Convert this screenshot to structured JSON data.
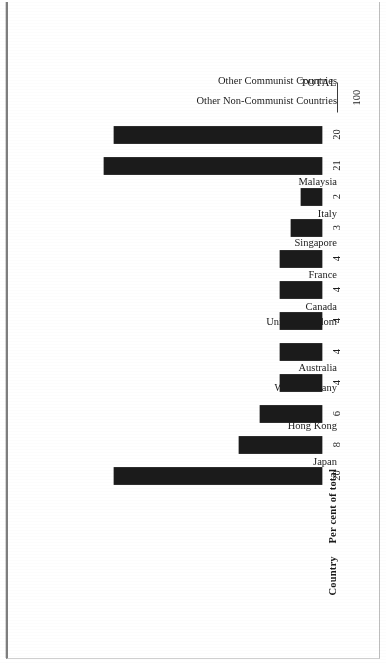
{
  "document": {
    "kind": "scanned-page-bar-chart"
  },
  "headers": {
    "category_label": "Country",
    "value_label": "Per cent of total"
  },
  "total": {
    "label": "TOTAL",
    "value": "100"
  },
  "colors": {
    "bar": "#1b1b1b",
    "text": "#1c1c1c",
    "page": "#ffffff",
    "rule": "#3a3a3a"
  },
  "chart_data": {
    "type": "bar",
    "title": "",
    "xlabel": "Country",
    "ylabel": "Per cent of total",
    "ylim": [
      0,
      21
    ],
    "grid": false,
    "legend": "none",
    "orientation": "vertical",
    "categories": [
      "Japan",
      "Hong Kong",
      "West Germany",
      "Australia",
      "United Kingdom",
      "Canada",
      "France",
      "Singapore",
      "Italy",
      "Malaysia",
      "Other Non-Communist Countries",
      "Other Communist Countries"
    ],
    "values": [
      20,
      8,
      6,
      4,
      4,
      4,
      4,
      4,
      3,
      2,
      21,
      20
    ],
    "value_labels": [
      "20",
      "8",
      "6",
      "4",
      "4",
      "4",
      "4",
      "4",
      "3",
      "2",
      "21",
      "20"
    ],
    "total": 100
  }
}
